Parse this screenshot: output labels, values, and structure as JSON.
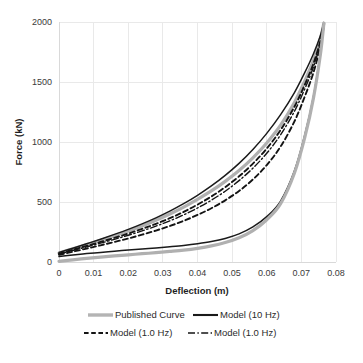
{
  "chart_data": {
    "type": "line",
    "title": "",
    "xlabel": "Deflection (m)",
    "ylabel": "Force (kN)",
    "xlim": [
      0,
      0.08
    ],
    "ylim": [
      0,
      2000
    ],
    "xticks": [
      "0",
      "0.01",
      "0.02",
      "0.03",
      "0.04",
      "0.05",
      "0.06",
      "0.07",
      "0.08"
    ],
    "yticks": [
      "0",
      "500",
      "1000",
      "1500",
      "2000"
    ],
    "xtick_values": [
      0,
      0.01,
      0.02,
      0.03,
      0.04,
      0.05,
      0.06,
      0.07,
      0.08
    ],
    "ytick_values": [
      0,
      500,
      1000,
      1500,
      2000
    ],
    "grid": true,
    "legend_position": "bottom",
    "legend": [
      {
        "label": "Published Curve",
        "style": "solid-thick-gray",
        "color": "#b0b0b0"
      },
      {
        "label": "Model (10 Hz)",
        "style": "solid-black",
        "color": "#1a1a1a"
      },
      {
        "label": "Model (1.0 Hz)",
        "style": "dashed-black",
        "color": "#141414"
      },
      {
        "label": "Model (1.0 Hz)",
        "style": "dashdot-black",
        "color": "#141414"
      }
    ],
    "series": [
      {
        "name": "Published Curve (upper branch)",
        "style": "solid-thick-gray",
        "x": [
          0.0,
          0.004,
          0.008,
          0.012,
          0.016,
          0.02,
          0.024,
          0.028,
          0.032,
          0.036,
          0.04,
          0.044,
          0.048,
          0.052,
          0.056,
          0.06,
          0.064,
          0.068,
          0.071,
          0.0735,
          0.0755,
          0.0765
        ],
        "y": [
          75,
          110,
          145,
          180,
          218,
          258,
          300,
          348,
          400,
          458,
          522,
          592,
          672,
          762,
          868,
          992,
          1140,
          1330,
          1510,
          1680,
          1860,
          1990
        ]
      },
      {
        "name": "Model (10 Hz) (upper branch)",
        "style": "solid-black",
        "x": [
          0.0,
          0.004,
          0.008,
          0.012,
          0.016,
          0.02,
          0.024,
          0.028,
          0.032,
          0.036,
          0.04,
          0.044,
          0.048,
          0.052,
          0.056,
          0.06,
          0.064,
          0.068,
          0.071,
          0.0735,
          0.0755,
          0.0765
        ],
        "y": [
          80,
          115,
          152,
          190,
          230,
          272,
          318,
          368,
          424,
          486,
          556,
          634,
          722,
          822,
          938,
          1072,
          1228,
          1412,
          1580,
          1736,
          1888,
          1995
        ]
      },
      {
        "name": "Model (1.0 Hz) dashed (upper branch)",
        "style": "dashed-black",
        "x": [
          0.0,
          0.004,
          0.008,
          0.012,
          0.016,
          0.02,
          0.024,
          0.028,
          0.032,
          0.036,
          0.04,
          0.044,
          0.048,
          0.052,
          0.056,
          0.06,
          0.064,
          0.068,
          0.071,
          0.0735,
          0.0755,
          0.0765
        ],
        "y": [
          70,
          102,
          134,
          167,
          201,
          237,
          276,
          318,
          365,
          418,
          478,
          546,
          624,
          714,
          820,
          946,
          1100,
          1294,
          1478,
          1654,
          1842,
          1982
        ]
      },
      {
        "name": "Model (1.0 Hz) dash-dot (upper branch)",
        "style": "dashdot-black",
        "x": [
          0.0,
          0.004,
          0.008,
          0.012,
          0.016,
          0.02,
          0.024,
          0.028,
          0.032,
          0.036,
          0.04,
          0.044,
          0.048,
          0.052,
          0.056,
          0.06,
          0.064,
          0.068,
          0.071,
          0.0735,
          0.0755,
          0.0765
        ],
        "y": [
          66,
          96,
          126,
          157,
          189,
          223,
          259,
          299,
          343,
          393,
          450,
          515,
          590,
          678,
          782,
          906,
          1060,
          1256,
          1444,
          1626,
          1822,
          1978
        ]
      },
      {
        "name": "Model (1.0 Hz) dashed (lower-mid branch)",
        "style": "dashed-black",
        "x": [
          0.0,
          0.004,
          0.008,
          0.012,
          0.016,
          0.02,
          0.024,
          0.028,
          0.032,
          0.036,
          0.04,
          0.044,
          0.048,
          0.052,
          0.056,
          0.06,
          0.064,
          0.068,
          0.071,
          0.0735,
          0.0755,
          0.0765
        ],
        "y": [
          60,
          86,
          112,
          139,
          167,
          196,
          228,
          262,
          300,
          343,
          392,
          448,
          514,
          592,
          688,
          808,
          962,
          1172,
          1380,
          1580,
          1800,
          1972
        ]
      },
      {
        "name": "Model (10 Hz) (lower branch)",
        "style": "solid-black",
        "x": [
          0.0,
          0.004,
          0.008,
          0.012,
          0.016,
          0.02,
          0.024,
          0.028,
          0.032,
          0.036,
          0.04,
          0.044,
          0.048,
          0.052,
          0.056,
          0.06,
          0.064,
          0.068,
          0.071,
          0.0735,
          0.0755,
          0.0765
        ],
        "y": [
          45,
          58,
          70,
          80,
          90,
          99,
          108,
          117,
          127,
          138,
          152,
          170,
          196,
          234,
          292,
          378,
          508,
          760,
          1060,
          1380,
          1740,
          1990
        ]
      },
      {
        "name": "Published Curve (lower branch)",
        "style": "solid-thick-gray",
        "x": [
          0.0,
          0.004,
          0.008,
          0.012,
          0.016,
          0.02,
          0.024,
          0.028,
          0.032,
          0.036,
          0.04,
          0.044,
          0.048,
          0.052,
          0.056,
          0.06,
          0.064,
          0.068,
          0.071,
          0.0735,
          0.0755,
          0.0765
        ],
        "y": [
          5,
          18,
          30,
          41,
          51,
          60,
          69,
          78,
          88,
          99,
          114,
          134,
          162,
          202,
          262,
          352,
          486,
          742,
          1040,
          1368,
          1730,
          1988
        ]
      }
    ]
  },
  "figure": {
    "background_color": "#ffffff",
    "grid_color": "#e9e9e9",
    "text_color": "#2b2b2b",
    "caption_faint": ""
  }
}
